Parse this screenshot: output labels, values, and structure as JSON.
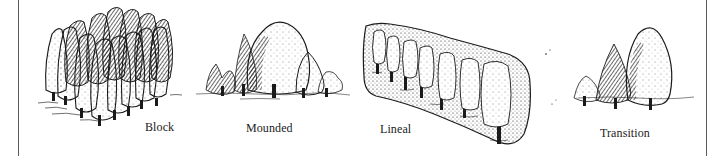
{
  "figure": {
    "panels": [
      {
        "id": "block",
        "label": "Block",
        "icon": "block-tree-planting-icon"
      },
      {
        "id": "mounded",
        "label": "Mounded",
        "icon": "mounded-tree-planting-icon"
      },
      {
        "id": "lineal",
        "label": "Lineal",
        "icon": "lineal-tree-planting-icon"
      },
      {
        "id": "transition",
        "label": "Transition",
        "icon": "transition-tree-planting-icon"
      }
    ]
  },
  "colors": {
    "ink": "#1a1a1a",
    "frame": "#5a5a5a",
    "background": "#ffffff"
  }
}
